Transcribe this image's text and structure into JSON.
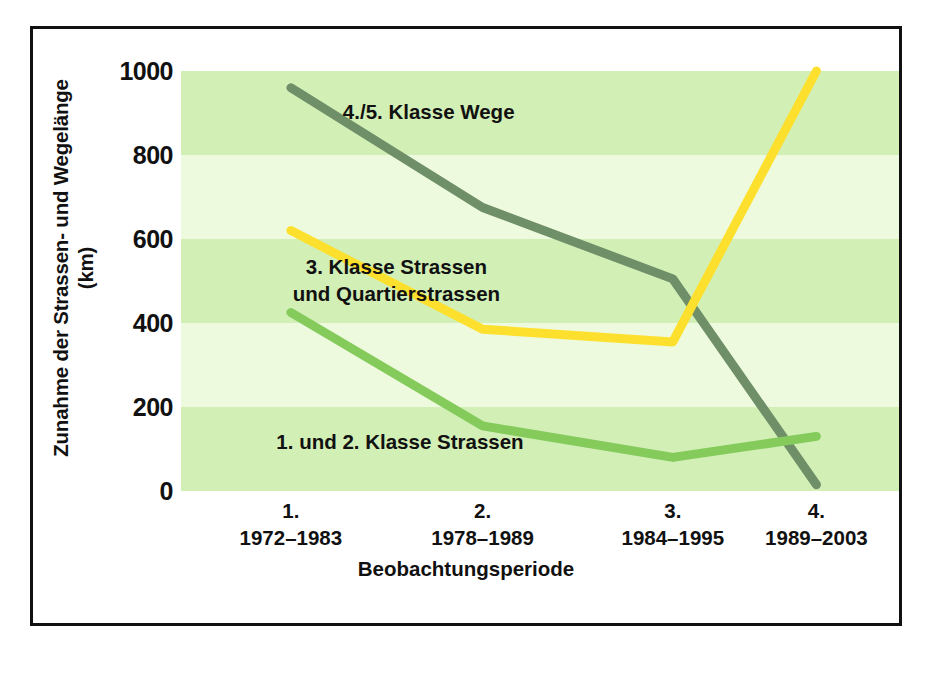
{
  "chart_data": {
    "type": "line",
    "title": "",
    "xlabel": "Beobachtungsperiode",
    "ylabel": "Zunahme der Strassen- und Wegelänge\n(km)",
    "ylabel_line1": "Zunahme der Strassen- und Wegelänge",
    "ylabel_line2": "(km)",
    "categories": [
      {
        "num": "1.",
        "range": "1972–1983"
      },
      {
        "num": "2.",
        "range": "1978–1989"
      },
      {
        "num": "3.",
        "range": "1984–1995"
      },
      {
        "num": "4.",
        "range": "1989–2003"
      }
    ],
    "x": [
      1,
      2,
      3,
      4
    ],
    "ylim": [
      0,
      1000
    ],
    "yticks": [
      0,
      200,
      400,
      600,
      800,
      1000
    ],
    "ytick_labels": [
      "0",
      "200",
      "400",
      "600",
      "800",
      "1000"
    ],
    "grid": false,
    "banded_background": true,
    "legend": "in-plot annotations",
    "series": [
      {
        "name": "4./5. Klasse Wege",
        "color": "#6e8f68",
        "values": [
          960,
          675,
          505,
          15
        ]
      },
      {
        "name": "3. Klasse Strassen und Quartierstrassen",
        "color": "#fde02e",
        "values": [
          620,
          385,
          355,
          1000
        ]
      },
      {
        "name": "1. und 2. Klasse Strassen",
        "color": "#84cb5c",
        "values": [
          425,
          155,
          80,
          130
        ]
      }
    ],
    "annotations": [
      {
        "text": "4./5. Klasse Wege",
        "x_frac": 0.345,
        "y_value": 900
      },
      {
        "text": "3. Klasse Strassen\nund Quartierstrassen",
        "x_frac": 0.3,
        "y_value": 530
      },
      {
        "text": "1. und 2. Klasse Strassen",
        "x_frac": 0.305,
        "y_value": 115
      }
    ],
    "background_bands": [
      {
        "from": 0,
        "to": 200,
        "color": "#d2efb6"
      },
      {
        "from": 200,
        "to": 400,
        "color": "#eefadd"
      },
      {
        "from": 400,
        "to": 600,
        "color": "#d2efb6"
      },
      {
        "from": 600,
        "to": 800,
        "color": "#eefadd"
      },
      {
        "from": 800,
        "to": 1000,
        "color": "#d2efb6"
      }
    ]
  },
  "colors": {
    "frame": "#111111",
    "text": "#111111",
    "page_background": "#ffffff",
    "band_dark": "#d2efb6",
    "band_light": "#eefadd",
    "series_wege": "#6e8f68",
    "series_quartier": "#fde02e",
    "series_strassen": "#84cb5c"
  }
}
